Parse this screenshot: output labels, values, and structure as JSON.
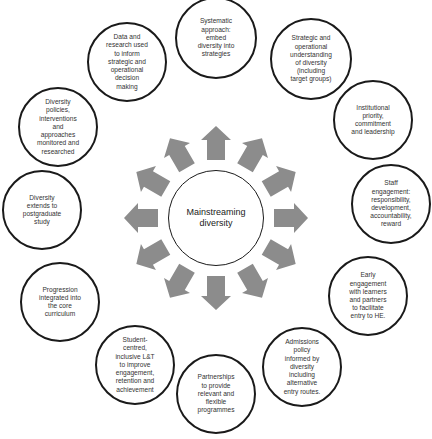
{
  "diagram": {
    "center": {
      "label": "Mainstreaming\ndiversity"
    },
    "arrow_color": "#8c8c8c",
    "circle_border": "#1a1a1a",
    "nodes": [
      {
        "label": "Systematic\napproach:\nembed\ndiversity into\nstrategies"
      },
      {
        "label": "Strategic and\noperational\nunderstanding\nof diversity\n(including\ntarget groups)"
      },
      {
        "label": "Institutional\npriority,\ncommitment\nand leadership"
      },
      {
        "label": "Staff\nengagement:\nresponsibility,\ndevelopment,\naccountability,\nreward"
      },
      {
        "label": "Early\nengagement\nwith learners\nand partners\nto facilitate\nentry to HE."
      },
      {
        "label": "Admissions\npolicy\ninformed by\ndiversity\nincluding\nalternative\nentry routes."
      },
      {
        "label": "Partnerships\nto provide\nrelevant and\nflexible\nprogrammes"
      },
      {
        "label": "Student-\ncentred,\ninclusive L&T\nto improve\nengagement,\nretention and\nachievement"
      },
      {
        "label": "Progression\nintegrated into\nthe core\ncurriculum"
      },
      {
        "label": "Diversity\nextends to\npostgraduate\nstudy"
      },
      {
        "label": "Diversity\npolicies,\ninterventions\nand\napproaches\nmonitored and\nresearched"
      },
      {
        "label": "Data and\nresearch used\nto inform\nstrategic and\noperational\ndecision\nmaking"
      }
    ]
  }
}
